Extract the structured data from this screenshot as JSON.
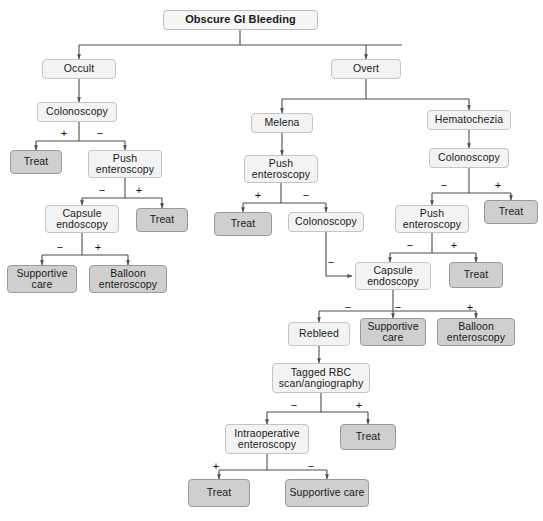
{
  "diagram": {
    "title": "Obscure GI Bleeding",
    "type": "clinical-decision-flowchart",
    "signs": {
      "positive": "+",
      "negative": "−"
    },
    "colors": {
      "light_node_fill": "#f3f3f3",
      "shaded_node_fill": "#cfcfcf",
      "node_border": "#b4b4b4",
      "edge": "#4d4d4d",
      "text": "#1a1a1a",
      "background": "#ffffff"
    },
    "nodes": [
      {
        "id": "root",
        "label": "Obscure GI Bleeding",
        "style": "root",
        "x": 163,
        "y": 10,
        "w": 155,
        "h": 20
      },
      {
        "id": "occult",
        "label": "Occult",
        "style": "light",
        "x": 42,
        "y": 59,
        "w": 74,
        "h": 20
      },
      {
        "id": "overt",
        "label": "Overt",
        "style": "light",
        "x": 331,
        "y": 59,
        "w": 70,
        "h": 20
      },
      {
        "id": "colonoscopy_l",
        "label": "Colonoscopy",
        "style": "light",
        "x": 37,
        "y": 102,
        "w": 80,
        "h": 20
      },
      {
        "id": "treat_l1",
        "label": "Treat",
        "style": "shaded",
        "x": 10,
        "y": 150,
        "w": 52,
        "h": 24
      },
      {
        "id": "push_l",
        "label": "Push enteroscopy",
        "style": "light",
        "x": 88,
        "y": 150,
        "w": 74,
        "h": 28
      },
      {
        "id": "capsule_l",
        "label": "Capsule endoscopy",
        "style": "light",
        "x": 45,
        "y": 205,
        "w": 74,
        "h": 28
      },
      {
        "id": "treat_l2",
        "label": "Treat",
        "style": "shaded",
        "x": 136,
        "y": 208,
        "w": 52,
        "h": 24
      },
      {
        "id": "supportive_l",
        "label": "Supportive care",
        "style": "shaded",
        "x": 7,
        "y": 265,
        "w": 70,
        "h": 28
      },
      {
        "id": "balloon_l",
        "label": "Balloon enteroscopy",
        "style": "shaded",
        "x": 89,
        "y": 265,
        "w": 78,
        "h": 28
      },
      {
        "id": "melena",
        "label": "Melena",
        "style": "light",
        "x": 251,
        "y": 113,
        "w": 62,
        "h": 20
      },
      {
        "id": "push_m",
        "label": "Push enteroscopy",
        "style": "light",
        "x": 244,
        "y": 155,
        "w": 74,
        "h": 28
      },
      {
        "id": "treat_m",
        "label": "Treat",
        "style": "shaded",
        "x": 214,
        "y": 212,
        "w": 58,
        "h": 24
      },
      {
        "id": "colonoscopy_m",
        "label": "Colonoscopy",
        "style": "light",
        "x": 288,
        "y": 212,
        "w": 76,
        "h": 20
      },
      {
        "id": "hematochezia",
        "label": "Hematochezia",
        "style": "light",
        "x": 427,
        "y": 110,
        "w": 84,
        "h": 20
      },
      {
        "id": "colonoscopy_r",
        "label": "Colonoscopy",
        "style": "light",
        "x": 429,
        "y": 148,
        "w": 80,
        "h": 20
      },
      {
        "id": "push_r",
        "label": "Push enteroscopy",
        "style": "light",
        "x": 395,
        "y": 205,
        "w": 74,
        "h": 28
      },
      {
        "id": "treat_r1",
        "label": "Treat",
        "style": "shaded",
        "x": 484,
        "y": 200,
        "w": 54,
        "h": 24
      },
      {
        "id": "treat_r2",
        "label": "Treat",
        "style": "shaded",
        "x": 449,
        "y": 262,
        "w": 54,
        "h": 26
      },
      {
        "id": "capsule_c",
        "label": "Capsule endoscopy",
        "style": "light",
        "x": 355,
        "y": 262,
        "w": 76,
        "h": 28
      },
      {
        "id": "rebleed",
        "label": "Rebleed",
        "style": "light",
        "x": 288,
        "y": 322,
        "w": 62,
        "h": 24
      },
      {
        "id": "supportive_c",
        "label": "Supportive care",
        "style": "shaded",
        "x": 360,
        "y": 318,
        "w": 66,
        "h": 28
      },
      {
        "id": "balloon_c",
        "label": "Balloon enteroscopy",
        "style": "shaded",
        "x": 437,
        "y": 318,
        "w": 78,
        "h": 28
      },
      {
        "id": "tagged_rbc",
        "label": "Tagged RBC scan/angiography",
        "style": "light",
        "x": 272,
        "y": 363,
        "w": 98,
        "h": 30
      },
      {
        "id": "intraop",
        "label": "Intraoperative enteroscopy",
        "style": "light",
        "x": 225,
        "y": 424,
        "w": 84,
        "h": 30
      },
      {
        "id": "treat_b1",
        "label": "Treat",
        "style": "shaded",
        "x": 340,
        "y": 424,
        "w": 56,
        "h": 26
      },
      {
        "id": "treat_b2",
        "label": "Treat",
        "style": "shaded",
        "x": 188,
        "y": 479,
        "w": 62,
        "h": 28
      },
      {
        "id": "supportive_b",
        "label": "Supportive care",
        "style": "shaded",
        "x": 285,
        "y": 479,
        "w": 84,
        "h": 28
      }
    ],
    "sign_labels": [
      {
        "sign": "+",
        "x": 58,
        "y": 128
      },
      {
        "sign": "−",
        "x": 94,
        "y": 128
      },
      {
        "sign": "−",
        "x": 96,
        "y": 185
      },
      {
        "sign": "+",
        "x": 133,
        "y": 185
      },
      {
        "sign": "−",
        "x": 54,
        "y": 242
      },
      {
        "sign": "+",
        "x": 92,
        "y": 242
      },
      {
        "sign": "+",
        "x": 252,
        "y": 190
      },
      {
        "sign": "−",
        "x": 300,
        "y": 190
      },
      {
        "sign": "−",
        "x": 325,
        "y": 257
      },
      {
        "sign": "−",
        "x": 438,
        "y": 180
      },
      {
        "sign": "+",
        "x": 492,
        "y": 180
      },
      {
        "sign": "−",
        "x": 404,
        "y": 240
      },
      {
        "sign": "+",
        "x": 448,
        "y": 240
      },
      {
        "sign": "−",
        "x": 342,
        "y": 302
      },
      {
        "sign": "−",
        "x": 392,
        "y": 302
      },
      {
        "sign": "+",
        "x": 464,
        "y": 302
      },
      {
        "sign": "−",
        "x": 288,
        "y": 400
      },
      {
        "sign": "+",
        "x": 353,
        "y": 400
      },
      {
        "sign": "+",
        "x": 210,
        "y": 461
      },
      {
        "sign": "−",
        "x": 305,
        "y": 461
      }
    ],
    "edges": [
      {
        "from": "root",
        "to": "occult",
        "label": ""
      },
      {
        "from": "root",
        "to": "overt",
        "label": ""
      },
      {
        "from": "occult",
        "to": "colonoscopy_l",
        "label": ""
      },
      {
        "from": "colonoscopy_l",
        "to": "treat_l1",
        "label": "+"
      },
      {
        "from": "colonoscopy_l",
        "to": "push_l",
        "label": "−"
      },
      {
        "from": "push_l",
        "to": "capsule_l",
        "label": "−"
      },
      {
        "from": "push_l",
        "to": "treat_l2",
        "label": "+"
      },
      {
        "from": "capsule_l",
        "to": "supportive_l",
        "label": "−"
      },
      {
        "from": "capsule_l",
        "to": "balloon_l",
        "label": "+"
      },
      {
        "from": "overt",
        "to": "melena",
        "label": ""
      },
      {
        "from": "overt",
        "to": "hematochezia",
        "label": ""
      },
      {
        "from": "melena",
        "to": "push_m",
        "label": ""
      },
      {
        "from": "push_m",
        "to": "treat_m",
        "label": "+"
      },
      {
        "from": "push_m",
        "to": "colonoscopy_m",
        "label": "−"
      },
      {
        "from": "colonoscopy_m",
        "to": "capsule_c",
        "label": "−"
      },
      {
        "from": "hematochezia",
        "to": "colonoscopy_r",
        "label": ""
      },
      {
        "from": "colonoscopy_r",
        "to": "push_r",
        "label": "−"
      },
      {
        "from": "colonoscopy_r",
        "to": "treat_r1",
        "label": "+"
      },
      {
        "from": "push_r",
        "to": "capsule_c",
        "label": "−"
      },
      {
        "from": "push_r",
        "to": "treat_r2",
        "label": "+"
      },
      {
        "from": "capsule_c",
        "to": "rebleed",
        "label": "−"
      },
      {
        "from": "capsule_c",
        "to": "supportive_c",
        "label": "−"
      },
      {
        "from": "capsule_c",
        "to": "balloon_c",
        "label": "+"
      },
      {
        "from": "rebleed",
        "to": "tagged_rbc",
        "label": ""
      },
      {
        "from": "tagged_rbc",
        "to": "intraop",
        "label": "−"
      },
      {
        "from": "tagged_rbc",
        "to": "treat_b1",
        "label": "+"
      },
      {
        "from": "intraop",
        "to": "treat_b2",
        "label": "+"
      },
      {
        "from": "intraop",
        "to": "supportive_b",
        "label": "−"
      }
    ]
  }
}
